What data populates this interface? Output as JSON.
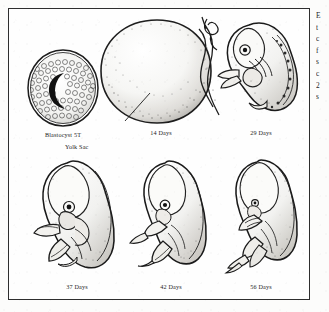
{
  "figure": {
    "border_color": "#2e2e2e",
    "background_color": "#fefefe",
    "ink_color": "#1a1a1a",
    "rows": [
      {
        "row_index": 1,
        "cells": [
          {
            "id": "blastocyst",
            "caption": "Blastocyst  5T",
            "icon": "blastocyst-illustration"
          },
          {
            "id": "yolksac",
            "caption": "14 Days",
            "pointer_label": "Yolk Sac",
            "icon": "yolk-sac-illustration"
          },
          {
            "id": "day29",
            "caption": "29 Days",
            "icon": "embryo-29-days-illustration"
          }
        ]
      },
      {
        "row_index": 2,
        "cells": [
          {
            "id": "day37",
            "caption": "37 Days",
            "icon": "embryo-37-days-illustration"
          },
          {
            "id": "day42",
            "caption": "42 Days",
            "icon": "embryo-42-days-illustration"
          },
          {
            "id": "day56",
            "caption": "56 Days",
            "icon": "embryo-56-days-illustration"
          }
        ]
      }
    ]
  },
  "cut_off_text_column": {
    "description": "partially visible body-text column clipped at the right page edge",
    "lines": [
      "E",
      "t",
      "c",
      "f",
      "s",
      "c",
      "2",
      "s"
    ]
  }
}
